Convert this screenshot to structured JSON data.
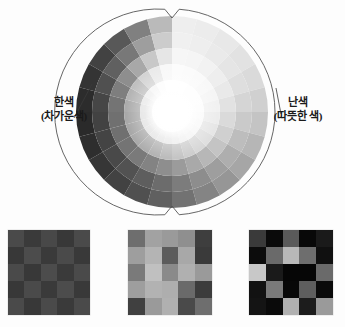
{
  "figure": {
    "type": "color-temperature-wheel-diagram"
  },
  "labels": {
    "cool": {
      "main": "한색",
      "sub": "(차가운색)"
    },
    "warm": {
      "main": "난색",
      "sub": "(따뜻한 색)"
    }
  },
  "wheel": {
    "center_x": 172,
    "center_y": 112,
    "outer_arc_radius": 103,
    "segments": 24,
    "rings": 5,
    "ring_radii": [
      96,
      80,
      64,
      48,
      32
    ],
    "center_glow_radius": 26,
    "notch_top": true,
    "notch_bottom": true,
    "arc_color": "#555555",
    "ring_values": [
      [
        238,
        236,
        232,
        226,
        218,
        208,
        196,
        182,
        166,
        150,
        132,
        114,
        96,
        80,
        66,
        54,
        46,
        42,
        44,
        52,
        66,
        88,
        128,
        186
      ],
      [
        240,
        238,
        234,
        229,
        222,
        213,
        202,
        189,
        174,
        158,
        141,
        124,
        108,
        94,
        82,
        73,
        68,
        66,
        70,
        80,
        96,
        120,
        158,
        204
      ],
      [
        246,
        245,
        242,
        238,
        233,
        226,
        218,
        208,
        196,
        183,
        169,
        155,
        142,
        131,
        122,
        116,
        112,
        112,
        116,
        126,
        142,
        168,
        200,
        230
      ],
      [
        252,
        251,
        250,
        248,
        245,
        241,
        236,
        230,
        223,
        215,
        206,
        197,
        188,
        180,
        174,
        170,
        168,
        168,
        172,
        180,
        192,
        212,
        234,
        248
      ],
      [
        255,
        255,
        254,
        254,
        253,
        252,
        250,
        248,
        246,
        243,
        240,
        236,
        232,
        229,
        226,
        224,
        223,
        223,
        225,
        230,
        237,
        245,
        252,
        255
      ]
    ]
  },
  "swatches": [
    {
      "name": "low-contrast-checkerboard",
      "cells": [
        "#4a4a4a",
        "#3a3a3a",
        "#484848",
        "#383838",
        "#4a4a4a",
        "#383838",
        "#4c4c4c",
        "#3a3a3a",
        "#4a4a4a",
        "#393939",
        "#4a4a4a",
        "#383838",
        "#4c4c4c",
        "#3a3a3a",
        "#4a4a4a",
        "#383838",
        "#4a4a4a",
        "#3a3a3a",
        "#4c4c4c",
        "#393939",
        "#4a4a4a",
        "#383838",
        "#4a4a4a",
        "#3a3a3a",
        "#4a4a4a"
      ]
    },
    {
      "name": "medium-contrast-checkerboard",
      "cells": [
        "#6e6e6e",
        "#a2a2a2",
        "#9a9a9a",
        "#8f8f8f",
        "#3e3e3e",
        "#9e9e9e",
        "#b4b4b4",
        "#5c5c5c",
        "#a8a8a8",
        "#3a3a3a",
        "#7a7a7a",
        "#c0c0c0",
        "#8a8a8a",
        "#b0b0b0",
        "#9a9a9a",
        "#9e9e9e",
        "#b2b2b2",
        "#aeaeae",
        "#6a6a6a",
        "#3c3c3c",
        "#404040",
        "#9a9a9a",
        "#b0b0b0",
        "#4a4a4a",
        "#6e6e6e"
      ]
    },
    {
      "name": "high-contrast-checkerboard",
      "cells": [
        "#3a3a3a",
        "#0a0a0a",
        "#5a5a5a",
        "#080808",
        "#1a1a1a",
        "#0c0c0c",
        "#6a6a6a",
        "#b8b8b8",
        "#6e6e6e",
        "#101010",
        "#c8c8c8",
        "#1a1a1a",
        "#060606",
        "#060606",
        "#6a6a6a",
        "#121212",
        "#7a7a7a",
        "#080808",
        "#5e5e5e",
        "#0a0a0a",
        "#141414",
        "#0a0a0a",
        "#b0b0b0",
        "#1c1c1c",
        "#9a9a9a"
      ]
    }
  ]
}
